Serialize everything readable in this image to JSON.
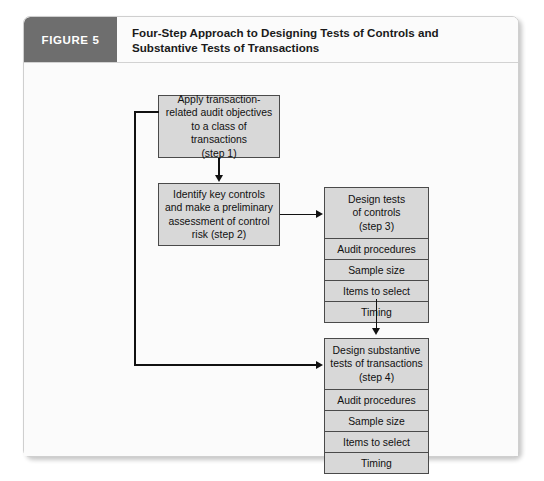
{
  "figure": {
    "tag": "FIGURE 5",
    "title": "Four-Step Approach to Designing Tests of Controls and Substantive Tests of Transactions",
    "title_line1": "Four-Step Approach to Designing Tests of Controls and",
    "title_line2": "Substantive Tests of Transactions"
  },
  "colors": {
    "tag_background": "#6e6e6e",
    "tag_text": "#ffffff",
    "node_fill": "#d8d8d8",
    "node_border": "#4a4a4a",
    "connector": "#111111",
    "frame_background": "#fbfbfb",
    "frame_border": "#cfcfcf"
  },
  "diagram": {
    "step1": {
      "lines": [
        "Apply transaction-",
        "related audit objectives",
        "to a class of transactions",
        "(step 1)"
      ],
      "text": "Apply transaction-related audit objectives to a class of transactions (step 1)"
    },
    "step2": {
      "lines": [
        "Identify key controls",
        "and make a preliminary",
        "assessment of control",
        "risk (step 2)"
      ],
      "text": "Identify key controls and make a preliminary assessment of control risk (step 2)"
    },
    "step3": {
      "head_lines": [
        "Design tests",
        "of controls",
        "(step 3)"
      ],
      "head_text": "Design tests of controls (step 3)",
      "rows": [
        "Audit procedures",
        "Sample size",
        "Items to select",
        "Timing"
      ]
    },
    "step4": {
      "head_lines": [
        "Design substantive",
        "tests of transactions",
        "(step 4)"
      ],
      "head_text": "Design substantive tests of transactions (step 4)",
      "rows": [
        "Audit procedures",
        "Sample size",
        "Items to select",
        "Timing"
      ]
    }
  }
}
